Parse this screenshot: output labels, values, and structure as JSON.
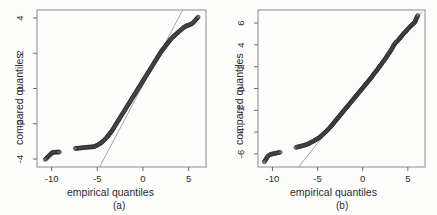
{
  "figure": {
    "panel_count": 2,
    "background_color": "#fdfdfc",
    "foreground_color": "#1a1a1a",
    "line_color": "#9a9a9a",
    "point_color": "#333333"
  },
  "chart_data": [
    {
      "type": "scatter",
      "panel": "a",
      "title": "",
      "caption": "(a)",
      "xlabel": "empirical quantiles",
      "ylabel": "compared quantiles",
      "xlim": [
        -11.6,
        6.9
      ],
      "ylim": [
        -4.45,
        4.45
      ],
      "xticks": [
        -10,
        -5,
        0,
        5
      ],
      "xtick_labels": [
        "-10",
        "-5",
        "0",
        "5"
      ],
      "yticks": [
        -4,
        -2,
        0,
        2,
        4
      ],
      "ytick_labels": [
        "-4",
        "-2",
        "0",
        "2",
        "4"
      ],
      "grid": false,
      "legend": "none",
      "box": true,
      "reference_line": {
        "description": "qq reference line",
        "x": [
          -4.75,
          4.35
        ],
        "y": [
          -4.45,
          4.45
        ],
        "color": "#9a9a9a"
      },
      "series": [
        {
          "name": "qq points",
          "x": [
            -10.7,
            -9.9,
            -9.15,
            -7.4,
            -7.0,
            -6.45,
            -6.1,
            -5.35,
            -5.15,
            -4.95,
            -4.8,
            -4.62,
            -4.45,
            -4.3,
            -4.15,
            -4.0,
            -3.85,
            -3.7,
            -3.55,
            -3.4,
            -3.25,
            -3.1,
            -2.95,
            -2.8,
            -2.65,
            -2.5,
            -2.35,
            -2.2,
            -2.05,
            -1.9,
            -1.75,
            -1.6,
            -1.45,
            -1.3,
            -1.15,
            -1.0,
            -0.85,
            -0.7,
            -0.55,
            -0.4,
            -0.25,
            -0.1,
            0.05,
            0.2,
            0.35,
            0.5,
            0.65,
            0.8,
            0.95,
            1.1,
            1.25,
            1.4,
            1.55,
            1.7,
            1.85,
            2.0,
            2.15,
            2.3,
            2.45,
            2.6,
            2.75,
            2.9,
            3.05,
            3.2,
            3.35,
            3.5,
            3.62,
            3.75,
            3.88,
            4.0,
            4.15,
            4.3,
            4.5,
            4.75,
            5.05,
            5.4,
            6.05
          ],
          "y": [
            -4.02,
            -3.62,
            -3.6,
            -3.4,
            -3.38,
            -3.35,
            -3.33,
            -3.3,
            -3.25,
            -3.2,
            -3.15,
            -3.1,
            -3.02,
            -2.95,
            -2.88,
            -2.8,
            -2.7,
            -2.6,
            -2.5,
            -2.4,
            -2.28,
            -2.15,
            -2.02,
            -1.9,
            -1.78,
            -1.65,
            -1.52,
            -1.4,
            -1.28,
            -1.15,
            -1.02,
            -0.9,
            -0.78,
            -0.65,
            -0.52,
            -0.4,
            -0.28,
            -0.15,
            -0.02,
            0.1,
            0.22,
            0.35,
            0.48,
            0.6,
            0.72,
            0.85,
            0.97,
            1.1,
            1.22,
            1.35,
            1.48,
            1.6,
            1.72,
            1.85,
            1.97,
            2.1,
            2.2,
            2.3,
            2.4,
            2.5,
            2.6,
            2.7,
            2.8,
            2.88,
            2.95,
            3.02,
            3.08,
            3.14,
            3.2,
            3.26,
            3.32,
            3.38,
            3.48,
            3.55,
            3.6,
            3.68,
            4.05
          ]
        }
      ]
    },
    {
      "type": "scatter",
      "panel": "b",
      "title": "",
      "caption": "(b)",
      "xlabel": "empirical quantiles",
      "ylabel": "compared quantiles",
      "xlim": [
        -11.6,
        6.9
      ],
      "ylim": [
        -7.2,
        7.2
      ],
      "xticks": [
        -10,
        -5,
        0,
        5
      ],
      "xtick_labels": [
        "-10",
        "-5",
        "0",
        "5"
      ],
      "yticks": [
        -6,
        -4,
        -2,
        0,
        2,
        4,
        6
      ],
      "ytick_labels": [
        "-6",
        "-4",
        "-2",
        "0",
        "2",
        "4",
        "6"
      ],
      "grid": false,
      "legend": "none",
      "box": true,
      "reference_line": {
        "description": "qq reference line",
        "x": [
          -7.1,
          6.6
        ],
        "y": [
          -7.2,
          7.05
        ],
        "color": "#9a9a9a"
      },
      "series": [
        {
          "name": "qq points",
          "x": [
            -10.9,
            -10.5,
            -10.25,
            -9.15,
            -7.4,
            -6.9,
            -6.45,
            -6.1,
            -5.5,
            -5.2,
            -5.0,
            -4.8,
            -4.6,
            -4.4,
            -4.2,
            -4.0,
            -3.8,
            -3.6,
            -3.4,
            -3.2,
            -3.0,
            -2.8,
            -2.6,
            -2.4,
            -2.2,
            -2.0,
            -1.8,
            -1.6,
            -1.4,
            -1.2,
            -1.0,
            -0.8,
            -0.6,
            -0.4,
            -0.2,
            0.0,
            0.2,
            0.4,
            0.6,
            0.8,
            1.0,
            1.2,
            1.4,
            1.6,
            1.8,
            2.0,
            2.2,
            2.4,
            2.6,
            2.8,
            3.0,
            3.2,
            3.4,
            3.55,
            3.7,
            3.85,
            4.0,
            4.2,
            4.4,
            4.6,
            4.85,
            5.1,
            5.4,
            5.75,
            6.1
          ],
          "y": [
            -6.72,
            -6.2,
            -6.05,
            -5.85,
            -5.4,
            -5.3,
            -5.2,
            -5.1,
            -4.85,
            -4.7,
            -4.6,
            -4.5,
            -4.35,
            -4.2,
            -4.05,
            -3.9,
            -3.72,
            -3.55,
            -3.35,
            -3.15,
            -2.95,
            -2.75,
            -2.55,
            -2.35,
            -2.15,
            -1.95,
            -1.75,
            -1.55,
            -1.35,
            -1.15,
            -0.95,
            -0.75,
            -0.55,
            -0.35,
            -0.15,
            0.05,
            0.25,
            0.45,
            0.65,
            0.85,
            1.05,
            1.3,
            1.5,
            1.7,
            1.95,
            2.15,
            2.4,
            2.6,
            2.85,
            3.1,
            3.35,
            3.6,
            3.9,
            4.1,
            4.25,
            4.35,
            4.5,
            4.7,
            4.9,
            5.1,
            5.3,
            5.55,
            5.8,
            6.05,
            6.7
          ]
        }
      ]
    }
  ]
}
